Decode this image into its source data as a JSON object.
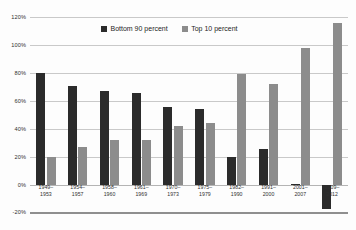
{
  "chart_data": {
    "type": "bar",
    "title": "",
    "xlabel": "",
    "ylabel": "",
    "ylim": [
      -20,
      120
    ],
    "grid": true,
    "legend_position": "top-center",
    "y_ticks": [
      "-20%",
      "0%",
      "20%",
      "40%",
      "60%",
      "80%",
      "100%",
      "120%"
    ],
    "y_tick_values": [
      -20,
      0,
      20,
      40,
      60,
      80,
      100,
      120
    ],
    "categories": [
      "1949–\n1953",
      "1954–\n1957",
      "1958–\n1960",
      "1961–\n1969",
      "1970–\n1973",
      "1975–\n1979",
      "1982–\n1990",
      "1991–\n2000",
      "2001–\n2007",
      "2009–\n2012"
    ],
    "category_lines": [
      [
        "1949–",
        "1953"
      ],
      [
        "1954–",
        "1957"
      ],
      [
        "1958–",
        "1960"
      ],
      [
        "1961–",
        "1969"
      ],
      [
        "1970–",
        "1973"
      ],
      [
        "1975–",
        "1979"
      ],
      [
        "1982–",
        "1990"
      ],
      [
        "1991–",
        "2000"
      ],
      [
        "2001–",
        "2007"
      ],
      [
        "2009–",
        "2012"
      ]
    ],
    "series": [
      {
        "name": "Bottom 90 percent",
        "color": "#2b2b2b",
        "values": [
          80,
          71,
          67,
          66,
          56,
          54,
          20,
          26,
          1,
          -17
        ]
      },
      {
        "name": "Top 10 percent",
        "color": "#8c8c8c",
        "values": [
          20,
          27,
          32,
          32,
          42,
          44,
          79,
          72,
          98,
          116
        ]
      }
    ]
  },
  "legend": {
    "items": [
      {
        "label": "Bottom 90 percent",
        "color": "#2b2b2b"
      },
      {
        "label": "Top 10 percent",
        "color": "#8c8c8c"
      }
    ]
  },
  "axis": {
    "y_ticks": [
      "120%",
      "100%",
      "80%",
      "60%",
      "40%",
      "20%",
      "0%",
      "-20%"
    ]
  }
}
